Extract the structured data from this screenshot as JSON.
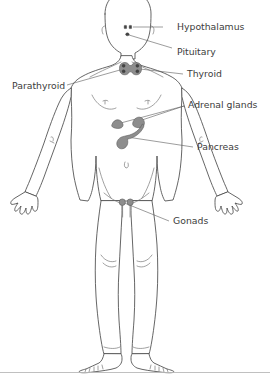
{
  "diagram": {
    "background_color": "#ffffff",
    "outline_color": "#4a4a4a",
    "organ_color": "#8d8d8d",
    "label_color": "#3c3c3c",
    "leader_color": "#5a5a5a"
  },
  "labels": [
    {
      "id": "hypothalamus",
      "text": "Hypothalamus",
      "text_x": 177,
      "text_y": 27,
      "anchor": "start",
      "leader_points": "163,27 135,27",
      "target_organ": "hypothalamus-marker"
    },
    {
      "id": "pituitary",
      "text": "Pituitary",
      "text_x": 177,
      "text_y": 52,
      "anchor": "start",
      "leader_points": "171,50 128,35",
      "target_organ": "pituitary-marker"
    },
    {
      "id": "thyroid",
      "text": "Thyroid",
      "text_x": 187,
      "text_y": 74,
      "anchor": "start",
      "leader_points": "182,74 141,69",
      "target_organ": "thyroid-shape"
    },
    {
      "id": "parathyroid",
      "text": "Parathyroid",
      "text_x": 12,
      "text_y": 87,
      "anchor": "start",
      "leader_points": "66,86 129,68",
      "target_organ": "parathyroid-dots"
    },
    {
      "id": "adrenal-glands",
      "text": "Adrenal glands",
      "text_x": 186,
      "text_y": 105,
      "anchor": "start",
      "leader_points": "183,106 118,124",
      "leader_points_2": "183,106 137,122",
      "target_organ": "adrenal-left"
    },
    {
      "id": "pancreas",
      "text": "Pancreas",
      "text_x": 196,
      "text_y": 148,
      "anchor": "start",
      "leader_points": "192,148 126,137",
      "target_organ": "pancreas-shape"
    },
    {
      "id": "gonads",
      "text": "Gonads",
      "text_x": 172,
      "text_y": 222,
      "anchor": "start",
      "leader_points": "168,221 121,202",
      "target_organ": "gonads-shape"
    }
  ],
  "organs": [
    {
      "id": "hypothalamus-marker",
      "name": "hypothalamus",
      "shape": "two small dots in the brain",
      "x": 127,
      "y": 27
    },
    {
      "id": "pituitary-marker",
      "name": "pituitary",
      "shape": "single small dot below hypothalamus",
      "x": 127,
      "y": 35
    },
    {
      "id": "thyroid-shape",
      "name": "thyroid",
      "shape": "butterfly shape at base of neck",
      "x": 133,
      "y": 69
    },
    {
      "id": "parathyroid-dots",
      "name": "parathyroid",
      "shape": "four dark dots on the thyroid",
      "x": 133,
      "y": 69
    },
    {
      "id": "adrenal-left",
      "name": "adrenal gland left",
      "shape": "triangular cap",
      "x": 118,
      "y": 124
    },
    {
      "id": "adrenal-right",
      "name": "adrenal gland right",
      "shape": "triangular cap",
      "x": 137,
      "y": 122
    },
    {
      "id": "pancreas-shape",
      "name": "pancreas",
      "shape": "elongated tapering organ across the upper abdomen",
      "x": 126,
      "y": 137
    },
    {
      "id": "gonads-shape",
      "name": "gonads",
      "shape": "two small rounded glands at the groin",
      "x": 121,
      "y": 202
    }
  ],
  "figure": {
    "view": "anterior",
    "parts": [
      "head",
      "neck",
      "shoulders",
      "torso",
      "left-arm",
      "right-arm",
      "left-hand",
      "right-hand",
      "left-leg",
      "right-leg",
      "left-foot",
      "right-foot"
    ]
  }
}
